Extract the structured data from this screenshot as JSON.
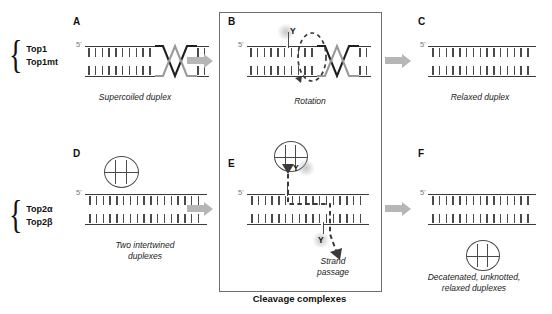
{
  "figure": {
    "bracket_label": "Cleavage complexes",
    "accent_arrow_color": "#b6b6b6",
    "strand_color": "#3b3b3b",
    "strand_color_gray": "#8d8d8d"
  },
  "enzyme_groups": [
    {
      "name": "top1-group",
      "members": [
        "Top1",
        "Top1mt"
      ]
    },
    {
      "name": "top2-group",
      "members": [
        "Top2α",
        "Top2β"
      ]
    }
  ],
  "panels": [
    {
      "letter": "A",
      "caption": "Supercoiled duplex",
      "five_prime": "5'"
    },
    {
      "letter": "B",
      "caption": "Rotation",
      "five_prime": "5'",
      "tyrosine": "Y"
    },
    {
      "letter": "C",
      "caption": "Relaxed duplex",
      "five_prime": "5'"
    },
    {
      "letter": "D",
      "caption": "Two intertwined\nduplexes",
      "five_prime": "5'"
    },
    {
      "letter": "E",
      "caption": "Strand\npassage",
      "five_prime": "5'",
      "tyrosine": "Y"
    },
    {
      "letter": "F",
      "caption": "Decatenated, unknotted,\nrelaxed duplexes",
      "five_prime": "5'"
    }
  ]
}
